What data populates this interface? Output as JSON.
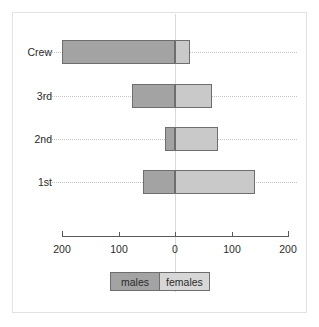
{
  "caption": {
    "clipped_text": "",
    "note": "top caption row is cropped out of frame"
  },
  "legend": {
    "males_label": "males",
    "females_label": "females",
    "males_color": "#a3a3a3",
    "females_color": "#d7d7d7"
  },
  "axis": {
    "tick_labels": [
      "200",
      "100",
      "0",
      "100",
      "200"
    ],
    "tick_values": [
      -200,
      -100,
      0,
      100,
      200
    ],
    "tick_px": [
      62,
      119,
      175,
      232,
      288
    ]
  },
  "categories": {
    "labels": [
      "Crew",
      "3rd",
      "2nd",
      "1st"
    ],
    "row_px": [
      52,
      96,
      139,
      182
    ]
  },
  "chart_data": {
    "type": "bar",
    "title": "",
    "subtitle": "",
    "xlabel": "",
    "ylabel": "",
    "orientation": "horizontal",
    "layout": "population-pyramid",
    "grid": true,
    "grid_style": "dotted-horizontal",
    "legend_position": "bottom-center",
    "zero_axis": 0,
    "xlim": [
      -200,
      200
    ],
    "xticks": [
      -200,
      -100,
      0,
      100,
      200
    ],
    "xticklabels": [
      "200",
      "100",
      "0",
      "100",
      "200"
    ],
    "categories": [
      "Crew",
      "3rd",
      "2nd",
      "1st"
    ],
    "series": [
      {
        "name": "males",
        "direction": "left",
        "color": "#a3a3a3",
        "values": [
          200,
          76,
          18,
          57
        ]
      },
      {
        "name": "females",
        "direction": "right",
        "color": "#c9c9c9",
        "values": [
          27,
          65,
          76,
          142
        ]
      }
    ]
  }
}
